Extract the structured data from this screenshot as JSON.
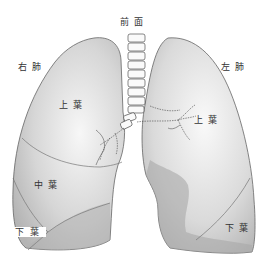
{
  "diagram": {
    "title": "前面",
    "labels": {
      "right_lung": "右肺",
      "left_lung": "左肺",
      "right_upper_lobe": "上葉",
      "right_middle_lobe": "中葉",
      "right_lower_lobe": "下葉",
      "left_upper_lobe": "上葉",
      "left_lower_lobe": "下葉"
    },
    "colors": {
      "lung_light": "#f2f2f2",
      "lung_mid": "#c8c8c8",
      "lung_dark": "#a8a8a8",
      "outline": "#555555"
    }
  }
}
